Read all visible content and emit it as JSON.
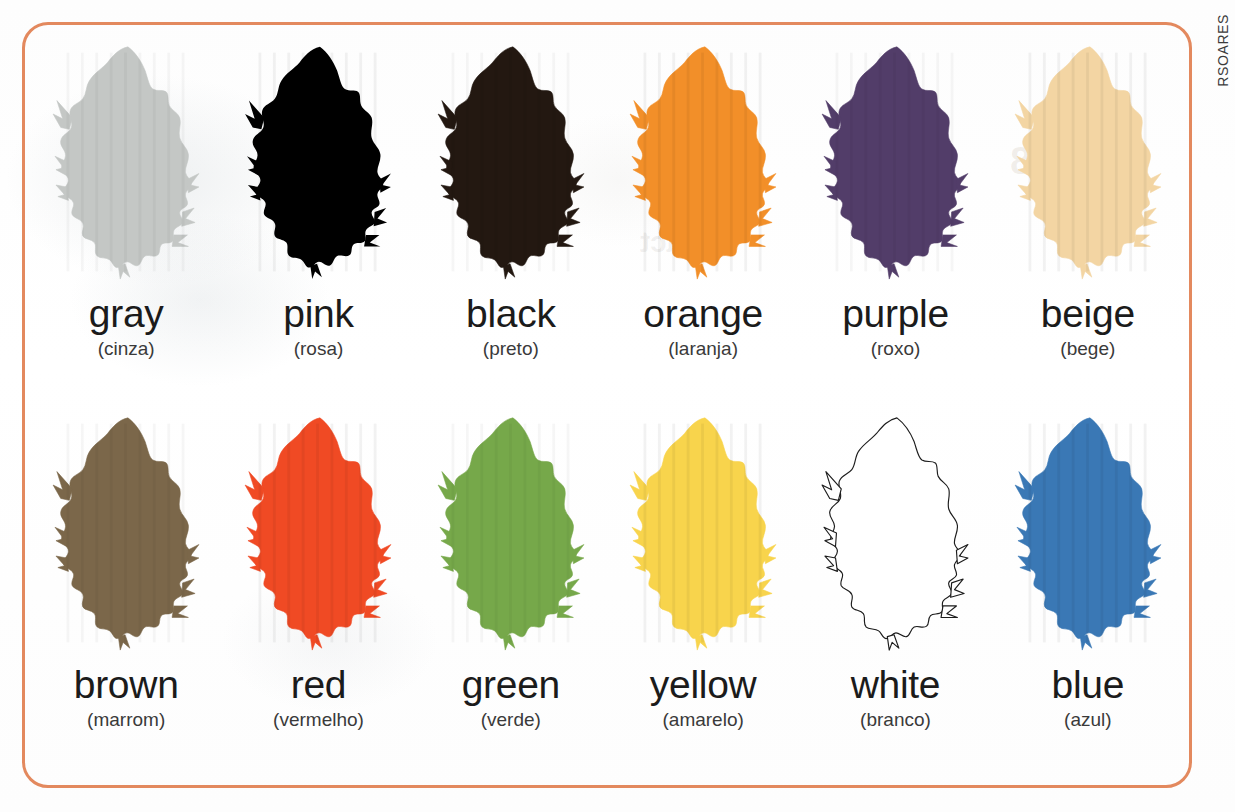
{
  "frame": {
    "border_color": "#e3895e",
    "corner_radius_px": 26
  },
  "credit": {
    "text": "RSOARES"
  },
  "background_color": "#ffffff",
  "swatches": [
    {
      "label_en": "gray",
      "label_pt": "(cinza)",
      "color": "#c4c7c5",
      "outline": false
    },
    {
      "label_en": "pink",
      "label_pt": "(rosa)",
      "color": "#e8days",
      "outline": false
    },
    {
      "label_en": "black",
      "label_pt": "(preto)",
      "color": "#231811",
      "outline": false
    },
    {
      "label_en": "orange",
      "label_pt": "(laranja)",
      "color": "#f28f29",
      "outline": false
    },
    {
      "label_en": "purple",
      "label_pt": "(roxo)",
      "color": "#523d69",
      "outline": false
    },
    {
      "label_en": "beige",
      "label_pt": "(bege)",
      "color": "#f3d5a3",
      "outline": false
    },
    {
      "label_en": "brown",
      "label_pt": "(marrom)",
      "color": "#7b674a",
      "outline": false
    },
    {
      "label_en": "red",
      "label_pt": "(vermelho)",
      "color": "#f04a24",
      "outline": false
    },
    {
      "label_en": "green",
      "label_pt": "(verde)",
      "color": "#76a84a",
      "outline": false
    },
    {
      "label_en": "yellow",
      "label_pt": "(amarelo)",
      "color": "#f8d44c",
      "outline": false
    },
    {
      "label_en": "white",
      "label_pt": "(branco)",
      "color": "#ffffff",
      "outline": true
    },
    {
      "label_en": "blue",
      "label_pt": "(azul)",
      "color": "#3a78b5",
      "outline": false
    }
  ],
  "ghost_artifacts": {
    "a": "Fact",
    "b": "Fact",
    "c": "2.18",
    "d": "Fact"
  }
}
